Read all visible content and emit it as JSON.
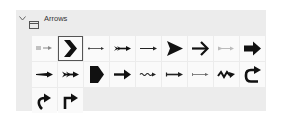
{
  "category": {
    "title": "Arrows",
    "expanded": true,
    "chevron_icon": "chevron-down-icon",
    "folder_icon": "folder-icon"
  },
  "shapes": [
    {
      "name": "dashed-arrow",
      "selected": false
    },
    {
      "name": "chevron-arrow",
      "selected": true
    },
    {
      "name": "thin-dotted-arrow",
      "selected": false
    },
    {
      "name": "feathered-arrow",
      "selected": false
    },
    {
      "name": "thin-arrow",
      "selected": false
    },
    {
      "name": "notched-triangle-arrow",
      "selected": false
    },
    {
      "name": "open-bold-arrow",
      "selected": false
    },
    {
      "name": "light-gray-arrow",
      "selected": false
    },
    {
      "name": "block-arrow",
      "selected": false
    },
    {
      "name": "tapered-arrow",
      "selected": false
    },
    {
      "name": "double-feather-arrow",
      "selected": false
    },
    {
      "name": "pentagon-arrow",
      "selected": false
    },
    {
      "name": "bold-line-arrow",
      "selected": false
    },
    {
      "name": "wavy-arrow",
      "selected": false
    },
    {
      "name": "tail-arrow",
      "selected": false
    },
    {
      "name": "dotted-tail-arrow",
      "selected": false
    },
    {
      "name": "zigzag-arrow",
      "selected": false
    },
    {
      "name": "u-turn-arrow",
      "selected": false
    },
    {
      "name": "curved-up-right-arrow",
      "selected": false
    },
    {
      "name": "bent-up-right-arrow",
      "selected": false
    }
  ]
}
